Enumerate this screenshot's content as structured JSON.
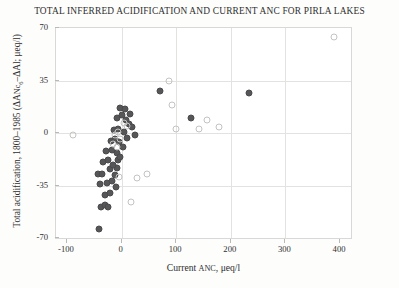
{
  "chart_data": {
    "type": "scatter",
    "title": "TOTAL INFERRED ACIDIFICATION AND CURRENT ANC FOR PIRLA LAKES",
    "xlabel": "Current ANC, μeq/l",
    "ylabel": "Total acidification, 1800–1985 (ΔANc₆–ΔAl; μeq/l)",
    "ylabel_parts": {
      "main": "Total acidification, 1800–1985  (ΔA",
      "smallcaps": "Nc",
      "sub": "6",
      "tail": "–ΔAl; μeq/l)"
    },
    "xlabel_parts": {
      "lead": "Current ",
      "smallcaps": "ANC",
      "tail": ", μeq/l"
    },
    "xlim": [
      -120,
      420
    ],
    "ylim": [
      -70,
      70
    ],
    "xticks": [
      -100,
      0,
      100,
      200,
      300,
      400
    ],
    "xtick_labels": [
      "-100",
      "0",
      "100",
      "200",
      "300",
      "400"
    ],
    "yticks": [
      -70,
      -35,
      0,
      35,
      70
    ],
    "ytick_labels": [
      "-70",
      "-35",
      "0",
      "35",
      "70"
    ],
    "grid": {
      "vertical_at": [
        0,
        100,
        200,
        300
      ],
      "horizontal_at": [
        0,
        35,
        -35
      ]
    },
    "legend": null,
    "legend_position": "none",
    "marker_colors": {
      "filled": "#565658",
      "open_stroke": "#c3c3c2"
    },
    "axis_color": "#d8d8d6",
    "grid_color": "#e2e2e0",
    "text_color": "#2e2e2e",
    "background": "#ffffff",
    "series": [
      {
        "name": "filled",
        "marker": "filled-circle",
        "points": [
          [
            -42,
            -64
          ],
          [
            -37,
            -49
          ],
          [
            -30,
            -48
          ],
          [
            -25,
            -49
          ],
          [
            -30,
            -41
          ],
          [
            -22,
            -40
          ],
          [
            -40,
            -34
          ],
          [
            -27,
            -33
          ],
          [
            -18,
            -32
          ],
          [
            -10,
            -36
          ],
          [
            -44,
            -27
          ],
          [
            -36,
            -27
          ],
          [
            -21,
            -24
          ],
          [
            -12,
            -28
          ],
          [
            -8,
            -23
          ],
          [
            -34,
            -19
          ],
          [
            -24,
            -18
          ],
          [
            -16,
            -21
          ],
          [
            -6,
            -18
          ],
          [
            -28,
            -12
          ],
          [
            -18,
            -11
          ],
          [
            -8,
            -13
          ],
          [
            -2,
            -16
          ],
          [
            -20,
            -5
          ],
          [
            -12,
            -4
          ],
          [
            -4,
            -6
          ],
          [
            2,
            -9
          ],
          [
            -14,
            2
          ],
          [
            -6,
            3
          ],
          [
            4,
            1
          ],
          [
            10,
            -3
          ],
          [
            -8,
            10
          ],
          [
            0,
            12
          ],
          [
            8,
            9
          ],
          [
            14,
            6
          ],
          [
            -2,
            17
          ],
          [
            6,
            16
          ],
          [
            16,
            13
          ],
          [
            20,
            4
          ],
          [
            24,
            -1
          ],
          [
            70,
            28
          ],
          [
            128,
            10
          ],
          [
            234,
            27
          ]
        ]
      },
      {
        "name": "open",
        "marker": "open-circle",
        "points": [
          [
            -88,
            -1
          ],
          [
            -12,
            -1
          ],
          [
            -6,
            1
          ],
          [
            -2,
            -4
          ],
          [
            -16,
            -7
          ],
          [
            -9,
            -9
          ],
          [
            4,
            7
          ],
          [
            10,
            5
          ],
          [
            -4,
            -29
          ],
          [
            28,
            -30
          ],
          [
            18,
            -46
          ],
          [
            46,
            -27
          ],
          [
            86,
            35
          ],
          [
            92,
            19
          ],
          [
            100,
            3
          ],
          [
            142,
            3
          ],
          [
            156,
            9
          ],
          [
            178,
            4
          ],
          [
            388,
            64
          ]
        ]
      }
    ]
  }
}
